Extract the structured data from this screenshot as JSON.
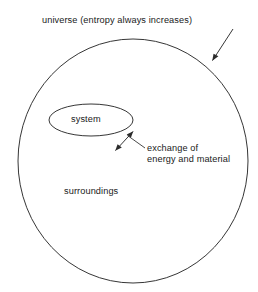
{
  "diagram": {
    "type": "thermodynamics-system-surroundings-venn",
    "background_color": "#ffffff",
    "stroke_color": "#2b2b2b",
    "text_color": "#1a1a1a",
    "labels": {
      "universe": "universe (entropy always increases)",
      "system": "system",
      "exchange_line1": "exchange of",
      "exchange_line2": "energy and material",
      "surroundings": "surroundings"
    },
    "shapes": {
      "universe_circle": {
        "name": "universe-boundary",
        "cx": 133,
        "cy": 161,
        "rx": 115,
        "ry": 122
      },
      "system_ellipse": {
        "name": "system-boundary",
        "cx": 91,
        "cy": 120,
        "rx": 42,
        "ry": 16
      }
    },
    "arrows": {
      "universe_pointer": {
        "name": "universe-leader-arrow",
        "from_x": 233,
        "from_y": 29,
        "to_x": 211,
        "to_y": 62,
        "heads": "single"
      },
      "exchange_double_arrow": {
        "name": "exchange-double-arrow",
        "from_x": 114,
        "from_y": 152,
        "to_x": 134,
        "to_y": 130,
        "heads": "double"
      },
      "exchange_leader": {
        "name": "exchange-label-leader",
        "from_x": 145,
        "from_y": 148,
        "to_x": 127,
        "to_y": 135,
        "heads": "none"
      }
    }
  }
}
